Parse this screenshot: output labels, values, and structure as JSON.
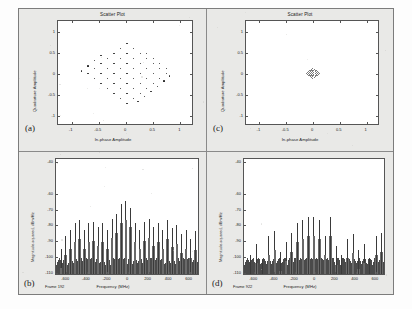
{
  "figure": {
    "panels": [
      {
        "letter": "(a)",
        "kind": "scatter",
        "title": "Scatter Plot",
        "xlabel": "In-phase Amplitude",
        "ylabel": "Quadrature Amplitude",
        "xticks": [
          "-1",
          "-0.5",
          "0",
          "0.5",
          "1"
        ],
        "yticks": [
          "1",
          "0.5",
          "0",
          "-0.5",
          "-1"
        ]
      },
      {
        "letter": "(c)",
        "kind": "scatter",
        "title": "Scatter Plot",
        "xlabel": "In-phase Amplitude",
        "ylabel": "Quadrature Amplitude",
        "xticks": [
          "-1",
          "-0.5",
          "0",
          "0.5",
          "1"
        ],
        "yticks": [
          "1",
          "0.5",
          "0",
          "-0.5",
          "-1"
        ]
      },
      {
        "letter": "(b)",
        "kind": "spectrum",
        "xlabel": "Frequency (MHz)",
        "ylabel": "Magnitude-squared, dBm/Hz",
        "frame_label": "Frame 192",
        "xticks": [
          "-600",
          "-400",
          "-200",
          "0",
          "200",
          "400",
          "600"
        ],
        "yticks": [
          "-40",
          "-60",
          "-70",
          "-80",
          "-90",
          "-100",
          "-110"
        ]
      },
      {
        "letter": "(d)",
        "kind": "spectrum",
        "xlabel": "Frequency (MHz)",
        "ylabel": "Magnitude-squared, dBm/Hz",
        "frame_label": "Frame 922",
        "xticks": [
          "-600",
          "-400",
          "-200",
          "0",
          "200",
          "400",
          "600"
        ],
        "yticks": [
          "-40",
          "-60",
          "-70",
          "-80",
          "-90",
          "-100",
          "-110"
        ]
      }
    ]
  },
  "chart_data": [
    {
      "type": "scatter",
      "id": "panel-a-constellation",
      "title": "Scatter Plot",
      "xlabel": "In-phase Amplitude",
      "ylabel": "Quadrature Amplitude",
      "xlim": [
        -1.25,
        1.25
      ],
      "ylim": [
        -1.25,
        1.25
      ],
      "xticks": [
        -1,
        -0.5,
        0,
        0.5,
        1
      ],
      "yticks": [
        -1,
        -0.5,
        0,
        0.5,
        1
      ],
      "grid": false,
      "legend": "none",
      "description": "Rotated 64-QAM style constellation, diamond (45-degree rotated square) envelope, 8x8 lattice",
      "points": [
        [
          0.02,
          0.72
        ],
        [
          -0.1,
          0.6
        ],
        [
          0.14,
          0.6
        ],
        [
          -0.22,
          0.48
        ],
        [
          0.02,
          0.48
        ],
        [
          0.26,
          0.48
        ],
        [
          -0.34,
          0.36
        ],
        [
          -0.1,
          0.36
        ],
        [
          0.14,
          0.36
        ],
        [
          0.38,
          0.36
        ],
        [
          -0.46,
          0.24
        ],
        [
          -0.22,
          0.24
        ],
        [
          0.02,
          0.24
        ],
        [
          0.26,
          0.24
        ],
        [
          0.5,
          0.24
        ],
        [
          -0.58,
          0.12
        ],
        [
          -0.34,
          0.12
        ],
        [
          -0.1,
          0.12
        ],
        [
          0.14,
          0.12
        ],
        [
          0.38,
          0.12
        ],
        [
          0.62,
          0.12
        ],
        [
          -0.7,
          0.0
        ],
        [
          -0.46,
          0.0
        ],
        [
          -0.22,
          0.0
        ],
        [
          0.02,
          0.0
        ],
        [
          0.26,
          0.0
        ],
        [
          0.5,
          0.0
        ],
        [
          0.74,
          0.0
        ],
        [
          -0.58,
          -0.12
        ],
        [
          -0.34,
          -0.12
        ],
        [
          -0.1,
          -0.12
        ],
        [
          0.14,
          -0.12
        ],
        [
          0.38,
          -0.12
        ],
        [
          0.62,
          -0.12
        ],
        [
          0.8,
          -0.06
        ],
        [
          -0.46,
          -0.24
        ],
        [
          -0.22,
          -0.24
        ],
        [
          0.02,
          -0.24
        ],
        [
          0.26,
          -0.24
        ],
        [
          0.5,
          -0.24
        ],
        [
          0.7,
          -0.18
        ],
        [
          -0.34,
          -0.36
        ],
        [
          -0.1,
          -0.36
        ],
        [
          0.14,
          -0.36
        ],
        [
          0.38,
          -0.36
        ],
        [
          0.58,
          -0.3
        ],
        [
          -0.22,
          -0.48
        ],
        [
          0.02,
          -0.48
        ],
        [
          0.26,
          -0.48
        ],
        [
          0.46,
          -0.42
        ],
        [
          -0.1,
          -0.6
        ],
        [
          0.14,
          -0.6
        ],
        [
          0.34,
          -0.54
        ],
        [
          0.02,
          -0.72
        ],
        [
          0.22,
          -0.66
        ],
        [
          -0.82,
          0.06
        ],
        [
          -0.7,
          0.18
        ],
        [
          -0.58,
          0.3
        ],
        [
          -0.46,
          0.42
        ],
        [
          0.74,
          0.12
        ],
        [
          0.62,
          0.24
        ],
        [
          0.5,
          0.36
        ],
        [
          0.38,
          0.48
        ]
      ]
    },
    {
      "type": "scatter",
      "id": "panel-c-constellation",
      "title": "Scatter Plot",
      "xlabel": "In-phase Amplitude",
      "ylabel": "Quadrature Amplitude",
      "xlim": [
        -1.25,
        1.25
      ],
      "ylim": [
        -1.25,
        1.25
      ],
      "xticks": [
        -1,
        -0.5,
        0,
        0.5,
        1
      ],
      "yticks": [
        -1,
        -0.5,
        0,
        0.5,
        1
      ],
      "grid": false,
      "legend": "none",
      "description": "Same constellation geometry compressed to a very small amplitude cluster near origin (low received power)",
      "scale": 0.16,
      "points": [
        [
          0.0,
          0.12
        ],
        [
          -0.02,
          0.1
        ],
        [
          0.03,
          0.1
        ],
        [
          -0.04,
          0.08
        ],
        [
          0.0,
          0.08
        ],
        [
          0.05,
          0.08
        ],
        [
          -0.06,
          0.06
        ],
        [
          -0.02,
          0.06
        ],
        [
          0.02,
          0.06
        ],
        [
          0.07,
          0.06
        ],
        [
          -0.08,
          0.04
        ],
        [
          -0.04,
          0.04
        ],
        [
          0.0,
          0.04
        ],
        [
          0.04,
          0.04
        ],
        [
          0.09,
          0.04
        ],
        [
          -0.1,
          0.02
        ],
        [
          -0.06,
          0.02
        ],
        [
          -0.02,
          0.02
        ],
        [
          0.02,
          0.02
        ],
        [
          0.06,
          0.02
        ],
        [
          0.1,
          0.02
        ],
        [
          -0.12,
          0.0
        ],
        [
          -0.08,
          0.0
        ],
        [
          -0.04,
          0.0
        ],
        [
          0.0,
          0.0
        ],
        [
          0.04,
          0.0
        ],
        [
          0.08,
          0.0
        ],
        [
          0.12,
          0.0
        ],
        [
          -0.1,
          -0.02
        ],
        [
          -0.06,
          -0.02
        ],
        [
          -0.02,
          -0.02
        ],
        [
          0.02,
          -0.02
        ],
        [
          0.06,
          -0.02
        ],
        [
          0.1,
          -0.02
        ],
        [
          -0.08,
          -0.04
        ],
        [
          -0.04,
          -0.04
        ],
        [
          0.0,
          -0.04
        ],
        [
          0.04,
          -0.04
        ],
        [
          0.09,
          -0.04
        ],
        [
          -0.06,
          -0.06
        ],
        [
          -0.02,
          -0.06
        ],
        [
          0.02,
          -0.06
        ],
        [
          0.07,
          -0.06
        ],
        [
          -0.04,
          -0.08
        ],
        [
          0.0,
          -0.08
        ],
        [
          0.05,
          -0.08
        ],
        [
          -0.02,
          -0.1
        ],
        [
          0.03,
          -0.1
        ],
        [
          0.0,
          -0.12
        ]
      ]
    },
    {
      "type": "line",
      "id": "panel-b-spectrum",
      "xlabel": "Frequency (MHz)",
      "ylabel": "Magnitude-squared, dBm/Hz",
      "annotation": "Frame 192",
      "xlim": [
        -700,
        700
      ],
      "ylim": [
        -112,
        -38
      ],
      "xticks": [
        -600,
        -400,
        -200,
        0,
        200,
        400,
        600
      ],
      "yticks": [
        -110,
        -100,
        -90,
        -80,
        -70,
        -60,
        -40
      ],
      "grid": false,
      "legend": "none",
      "description": "Comb of ~28 carrier tones over a -108 dBm/Hz noise floor; amplitude envelope peaks near DC",
      "noise_floor": -108,
      "tones_mhz": [
        -655,
        -610,
        -565,
        -520,
        -475,
        -430,
        -385,
        -340,
        -295,
        -250,
        -205,
        -160,
        -115,
        -70,
        -25,
        20,
        65,
        110,
        155,
        200,
        245,
        290,
        335,
        380,
        425,
        470,
        515,
        560,
        605,
        650
      ],
      "tone_peaks_db": [
        -96,
        -88,
        -84,
        -80,
        -78,
        -84,
        -80,
        -79,
        -82,
        -80,
        -84,
        -77,
        -74,
        -68,
        -66,
        -70,
        -80,
        -84,
        -79,
        -77,
        -82,
        -80,
        -84,
        -78,
        -83,
        -81,
        -87,
        -84,
        -90,
        -85
      ]
    },
    {
      "type": "line",
      "id": "panel-d-spectrum",
      "xlabel": "Frequency (MHz)",
      "ylabel": "Magnitude-squared, dBm/Hz",
      "annotation": "Frame 922",
      "xlim": [
        -700,
        700
      ],
      "ylim": [
        -112,
        -38
      ],
      "xticks": [
        -600,
        -400,
        -200,
        0,
        200,
        400,
        600
      ],
      "yticks": [
        -110,
        -100,
        -90,
        -80,
        -70,
        -60,
        -40
      ],
      "grid": false,
      "legend": "none",
      "description": "Sparser comb of ~22 carrier tones over a -108 dBm/Hz noise floor; envelope peaks near DC with deeper nulls",
      "noise_floor": -108,
      "tones_mhz": [
        -640,
        -580,
        -520,
        -460,
        -400,
        -345,
        -290,
        -235,
        -180,
        -125,
        -70,
        -15,
        40,
        95,
        150,
        205,
        260,
        315,
        370,
        425,
        480,
        535,
        600,
        650
      ],
      "tone_peaks_db": [
        -100,
        -93,
        -103,
        -88,
        -85,
        -98,
        -92,
        -86,
        -80,
        -78,
        -76,
        -76,
        -78,
        -88,
        -76,
        -94,
        -100,
        -90,
        -87,
        -97,
        -93,
        -102,
        -88,
        -86
      ]
    }
  ]
}
